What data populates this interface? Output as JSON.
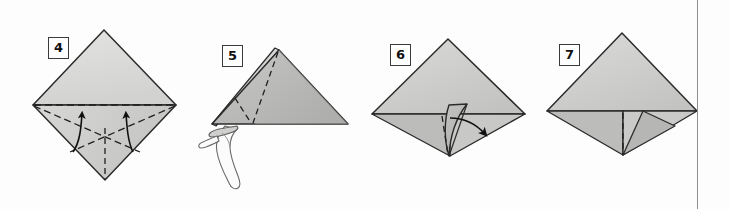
{
  "document": {
    "type": "origami-instruction-diagram",
    "title": "Origami folding sequence, steps 4 through 7",
    "background_color": "#fdfdfd",
    "page_border_color": "#8d8d8d"
  },
  "palette": {
    "paper_light": "#dededd",
    "paper_mid": "#c9c9c8",
    "paper_dark": "#a9a9a8",
    "paper_shadow": "#9a9a99",
    "outline": "#2b2b2b",
    "crease_dash": "#1f1f1f",
    "arrow": "#111111",
    "hand_outline": "#6a6a6a",
    "hand_fill": "#fbfbfb"
  },
  "steps": [
    {
      "number": "4",
      "badge_label": "4",
      "caption": "Square base seen as a diamond with valley creases; two arrows fold the lower edges up to the horizontal crease.",
      "shape": "diamond",
      "has_arrows": true,
      "arrow_count": 2,
      "has_hand": false,
      "dashed_creases": [
        "horizontal-midline",
        "left-diagonal",
        "right-diagonal",
        "vertical-center"
      ]
    },
    {
      "number": "5",
      "badge_label": "5",
      "caption": "Folded triangle held at the lower left corner by a hand; dashed creases mark the next fold.",
      "shape": "triangle",
      "has_arrows": false,
      "arrow_count": 0,
      "has_hand": true,
      "dashed_creases": [
        "long-diagonal",
        "short-v"
      ]
    },
    {
      "number": "6",
      "badge_label": "6",
      "caption": "Kite form with a raised inner flap; a curved arrow swings the flap to the right.",
      "shape": "kite-with-flap",
      "has_arrows": true,
      "arrow_count": 1,
      "has_hand": false,
      "dashed_creases": [
        "vertical-center"
      ]
    },
    {
      "number": "7",
      "badge_label": "7",
      "caption": "Completed form after the flap has been swung over; dashed centre crease remains.",
      "shape": "kite-folded",
      "has_arrows": false,
      "arrow_count": 0,
      "has_hand": false,
      "dashed_creases": [
        "vertical-center"
      ]
    }
  ]
}
